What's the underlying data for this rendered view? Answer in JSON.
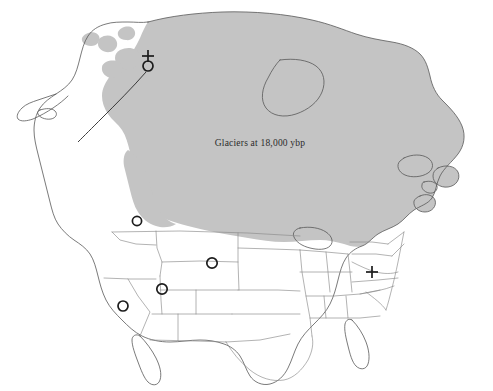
{
  "figure": {
    "type": "map",
    "region": "North America",
    "background_color": "#ffffff",
    "width": 493,
    "height": 391
  },
  "glacier": {
    "label": "Glaciers at 18,000 ybp",
    "fill_color": "#c4c4c4",
    "label_x": 260,
    "label_y": 146,
    "description": "Shaded ice sheet extent covering Canada, Greenland margin and the northern United States"
  },
  "outline": {
    "stroke_color": "#585858",
    "state_border_color": "#8a8a8a"
  },
  "markers": [
    {
      "id": "beringia-site",
      "symbol": "circle-with-cross",
      "x": 148,
      "y": 66,
      "radius": 5.0,
      "region": "Alaska / Beringia"
    },
    {
      "id": "pacific-northwest-site",
      "symbol": "circle",
      "x": 137,
      "y": 221,
      "radius": 4.6,
      "region": "Pacific Northwest"
    },
    {
      "id": "great-basin-site",
      "symbol": "circle",
      "x": 162,
      "y": 289,
      "radius": 5.2,
      "region": "Great Basin / Nevada"
    },
    {
      "id": "california-site",
      "symbol": "circle",
      "x": 123,
      "y": 306,
      "radius": 5.0,
      "region": "California"
    },
    {
      "id": "rocky-mountain-site",
      "symbol": "circle",
      "x": 212,
      "y": 263,
      "radius": 5.2,
      "region": "Colorado / Rocky Mountains"
    },
    {
      "id": "mid-atlantic-site",
      "symbol": "cross",
      "x": 372,
      "y": 272,
      "arm": 6.0,
      "region": "Virginia / Mid-Atlantic"
    }
  ],
  "migration_route": {
    "id": "bering-land-bridge-route",
    "stroke_color": "#2a2a2a",
    "description": "Line trailing southwest from the Alaska site across the Bering land bridge"
  }
}
